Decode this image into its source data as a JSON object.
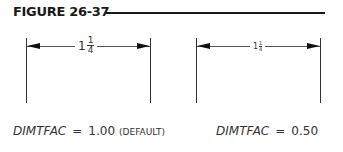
{
  "figure": {
    "title": "FIGURE 26-37"
  },
  "dimensions": [
    {
      "label_whole": "1",
      "label_numerator": "1",
      "label_denominator": "4",
      "scale": "large"
    },
    {
      "label_whole": "1",
      "label_numerator": "1",
      "label_denominator": "4",
      "scale": "small"
    }
  ],
  "captions": [
    {
      "variable": "DIMTFAC",
      "equals": "=",
      "value": "1.00",
      "note": "(DEFAULT)"
    },
    {
      "variable": "DIMTFAC",
      "equals": "=",
      "value": "0.50",
      "note": ""
    }
  ]
}
